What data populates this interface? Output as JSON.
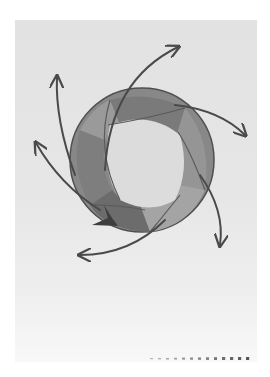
{
  "image": {
    "description": "Photograph of a hand-drawn pencil sketch on paper: a shaded circular ring with interlocking bands and six curved arrows radiating outward",
    "colors": {
      "background": "#ffffff",
      "paper": "#e4e4e4",
      "ring_dark": "#6e6e6e",
      "ring_mid": "#8a8a8a",
      "ring_light": "#a8a8a8",
      "inner": "#dedede",
      "stroke": "#4a4a4a"
    },
    "elements": {
      "ring": "shaded ring",
      "arrows": [
        {
          "name": "arrow-top-right",
          "direction": "up-right"
        },
        {
          "name": "arrow-right",
          "direction": "down-right"
        },
        {
          "name": "arrow-bottom-right",
          "direction": "down"
        },
        {
          "name": "arrow-bottom-left",
          "direction": "left"
        },
        {
          "name": "arrow-left",
          "direction": "up-left"
        },
        {
          "name": "arrow-upper-left",
          "direction": "up"
        }
      ],
      "dotted_line": "dotted line at bottom right"
    }
  }
}
